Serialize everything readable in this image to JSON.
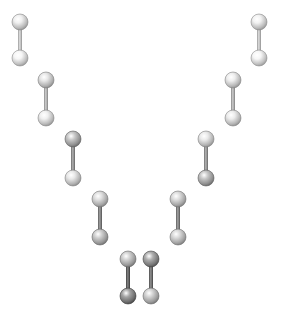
{
  "diagram": {
    "type": "molecule-arrangement",
    "background": "#ffffff",
    "atom_radius": 8,
    "bond_width": 4,
    "molecules": [
      {
        "id": "left-1",
        "top": {
          "x": 20,
          "y": 22,
          "shade": "#e6e6e6"
        },
        "bottom": {
          "x": 20,
          "y": 58,
          "shade": "#ececec"
        },
        "bond": "#b9b9b9"
      },
      {
        "id": "left-2",
        "top": {
          "x": 46,
          "y": 80,
          "shade": "#dcdcdc"
        },
        "bottom": {
          "x": 46,
          "y": 118,
          "shade": "#e6e6e6"
        },
        "bond": "#a9a9a9"
      },
      {
        "id": "left-3",
        "top": {
          "x": 73,
          "y": 139,
          "shade": "#bdbdbd"
        },
        "bottom": {
          "x": 73,
          "y": 178,
          "shade": "#dedede"
        },
        "bond": "#8a8a8a"
      },
      {
        "id": "left-4",
        "top": {
          "x": 100,
          "y": 199,
          "shade": "#d4d4d4"
        },
        "bottom": {
          "x": 100,
          "y": 237,
          "shade": "#c4c4c4"
        },
        "bond": "#7a7a7a"
      },
      {
        "id": "left-5",
        "top": {
          "x": 128,
          "y": 259,
          "shade": "#c6c6c6"
        },
        "bottom": {
          "x": 128,
          "y": 296,
          "shade": "#9a9a9a"
        },
        "bond": "#5e5e5e"
      },
      {
        "id": "right-5",
        "top": {
          "x": 151,
          "y": 259,
          "shade": "#a4a4a4"
        },
        "bottom": {
          "x": 151,
          "y": 296,
          "shade": "#c8c8c8"
        },
        "bond": "#6a6a6a"
      },
      {
        "id": "right-4",
        "top": {
          "x": 178,
          "y": 199,
          "shade": "#d2d2d2"
        },
        "bottom": {
          "x": 178,
          "y": 237,
          "shade": "#cfcfcf"
        },
        "bond": "#7c7c7c"
      },
      {
        "id": "right-3",
        "top": {
          "x": 206,
          "y": 139,
          "shade": "#e0e0e0"
        },
        "bottom": {
          "x": 206,
          "y": 178,
          "shade": "#bcbcbc"
        },
        "bond": "#8e8e8e"
      },
      {
        "id": "right-2",
        "top": {
          "x": 233,
          "y": 80,
          "shade": "#e4e4e4"
        },
        "bottom": {
          "x": 233,
          "y": 118,
          "shade": "#e2e2e2"
        },
        "bond": "#a6a6a6"
      },
      {
        "id": "right-1",
        "top": {
          "x": 259,
          "y": 22,
          "shade": "#e8e8e8"
        },
        "bottom": {
          "x": 259,
          "y": 58,
          "shade": "#ececec"
        },
        "bond": "#b8b8b8"
      }
    ]
  }
}
